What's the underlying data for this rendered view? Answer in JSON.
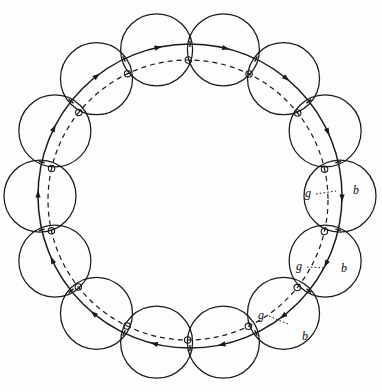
{
  "figure": {
    "background_color": "#fdfdfc",
    "ink_color": "#1a1a1a",
    "width": 382,
    "height": 392
  },
  "geometry": {
    "center_x": 190,
    "center_y": 196,
    "ring_radius": 150,
    "small_circle_radius": 36,
    "small_circle_count": 14,
    "solid_ring_radius": 152,
    "solid_ring_offset_x": 0,
    "solid_ring_offset_y": 0,
    "dashed_ring_radius": 140,
    "dashed_ring_offset_x": -2,
    "dashed_ring_offset_y": 4,
    "marker_dot_radius": 3.2,
    "marker_orbit_radius": 140,
    "marker_phase_deg": 13,
    "arrow_count": 14
  },
  "labels": [
    {
      "id": "g1",
      "text": "g",
      "x": 308,
      "y": 197
    },
    {
      "id": "b1",
      "text": "b",
      "x": 356,
      "y": 194
    },
    {
      "id": "g2",
      "text": "g",
      "x": 299,
      "y": 270
    },
    {
      "id": "b2",
      "text": "b",
      "x": 344,
      "y": 272
    },
    {
      "id": "g3",
      "text": "g",
      "x": 261,
      "y": 319
    },
    {
      "id": "b3",
      "text": "b",
      "x": 305,
      "y": 340
    }
  ],
  "leaders": [
    {
      "id": "leader-g1",
      "x1": 316,
      "y1": 194,
      "x2": 336,
      "y2": 191
    },
    {
      "id": "leader-g2",
      "x1": 307,
      "y1": 267,
      "x2": 326,
      "y2": 268
    },
    {
      "id": "leader-g3",
      "x1": 269,
      "y1": 316,
      "x2": 288,
      "y2": 324
    }
  ],
  "chart_data": {
    "type": "diagram",
    "series": [
      {
        "name": "small-circles",
        "count": 14,
        "radius": 36,
        "centers_radius": 150
      },
      {
        "name": "solid-ring",
        "radius": 152,
        "style": "solid",
        "arrowheads": 14
      },
      {
        "name": "dashed-ring",
        "radius": 140,
        "style": "dashed",
        "offset": [
          -2,
          4
        ]
      },
      {
        "name": "marker-dots",
        "count": 14,
        "radius": 3.2,
        "orbit_radius": 140
      }
    ],
    "annotations": [
      "g",
      "b",
      "g",
      "b",
      "g",
      "b"
    ],
    "title": "",
    "xlabel": "",
    "ylabel": ""
  }
}
